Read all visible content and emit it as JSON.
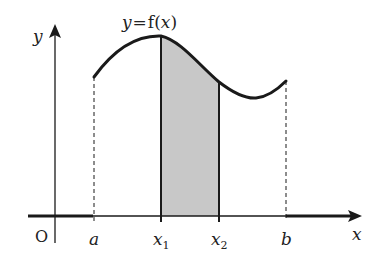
{
  "diagram": {
    "title_label": "y = f(x)",
    "curve_label": {
      "y": "y",
      "eq": "=",
      "f": "f",
      "paren_open": "(",
      "x": "x",
      "paren_close": ")"
    },
    "axes": {
      "x_label": "x",
      "y_label": "y",
      "origin_label": "O"
    },
    "ticks": [
      {
        "id": "a",
        "label": "a"
      },
      {
        "id": "x1",
        "label": "x",
        "sub": "1"
      },
      {
        "id": "x2",
        "label": "x",
        "sub": "2"
      },
      {
        "id": "b",
        "label": "b"
      }
    ],
    "shaded_region": {
      "from": "x1",
      "to": "x2",
      "fill": "#c8c8c8"
    },
    "colors": {
      "stroke": "#1a1a1a",
      "shade": "#c8c8c8",
      "background": "#ffffff"
    }
  }
}
